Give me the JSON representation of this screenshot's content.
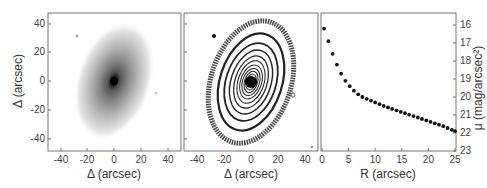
{
  "figure": {
    "panels": [
      {
        "id": "image-panel",
        "kind": "galaxy-image",
        "xlabel": "Δ (arcsec)",
        "ylabel": "Δ (arcsec)",
        "xticks": [
          "-40",
          "-20",
          "0",
          "20",
          "40"
        ],
        "yticks": [
          "40",
          "20",
          "0",
          "-20",
          "-40"
        ]
      },
      {
        "id": "isophote-panel",
        "kind": "isophote-contours",
        "xlabel": "Δ (arcsec)",
        "xticks": [
          "-40",
          "-20",
          "0",
          "20",
          "40"
        ]
      },
      {
        "id": "profile-panel",
        "kind": "surface-brightness-profile",
        "xlabel": "R (arcsec)",
        "ylabel": "μ (mag/arcsec²)",
        "xticks": [
          "0",
          "5",
          "10",
          "15",
          "20",
          "25"
        ],
        "yticks": [
          "16",
          "17",
          "18",
          "19",
          "20",
          "21",
          "22",
          "23"
        ]
      }
    ],
    "colors": {
      "frame": "#777777",
      "dots": "#111111",
      "text": "#444444"
    }
  },
  "chart_data": [
    {
      "type": "heatmap",
      "title": "",
      "xlabel": "Δ (arcsec)",
      "ylabel": "Δ (arcsec)",
      "xlim": [
        -47,
        47
      ],
      "ylim": [
        -47,
        47
      ],
      "xticks": [
        -40,
        -20,
        0,
        20,
        40
      ],
      "yticks": [
        -40,
        -20,
        0,
        20,
        40
      ],
      "description": "Grayscale image of elliptical galaxy, bright nucleus at (0,0), elongated along ~NW-SE tilt"
    },
    {
      "type": "heatmap",
      "title": "",
      "xlabel": "Δ (arcsec)",
      "ylabel": "",
      "xlim": [
        -47,
        47
      ],
      "ylim": [
        -47,
        47
      ],
      "xticks": [
        -40,
        -20,
        0,
        20,
        40
      ],
      "description": "Isophote contour map of same galaxy, nested tilted ellipses around center"
    },
    {
      "type": "scatter",
      "title": "",
      "xlabel": "R (arcsec)",
      "ylabel": "μ (mag/arcsec²)",
      "xlim": [
        0,
        25
      ],
      "ylim": [
        23,
        15.5
      ],
      "xticks": [
        0,
        5,
        10,
        15,
        20,
        25
      ],
      "yticks": [
        16,
        17,
        18,
        19,
        20,
        21,
        22,
        23
      ],
      "y_axis_position": "right",
      "y_inverted": true,
      "grid": false,
      "x": [
        0.4,
        1.2,
        2.0,
        2.8,
        3.6,
        4.4,
        5.2,
        6.0,
        6.8,
        7.6,
        8.4,
        9.2,
        10.0,
        10.8,
        11.6,
        12.4,
        13.2,
        14.0,
        14.8,
        15.6,
        16.4,
        17.2,
        18.0,
        18.8,
        19.6,
        20.4,
        21.2,
        22.0,
        22.8,
        23.6,
        24.4,
        25.0
      ],
      "y": [
        16.2,
        16.9,
        17.6,
        18.2,
        18.7,
        19.1,
        19.4,
        19.65,
        19.85,
        20.0,
        20.1,
        20.2,
        20.3,
        20.4,
        20.5,
        20.58,
        20.66,
        20.74,
        20.82,
        20.9,
        20.98,
        21.06,
        21.14,
        21.22,
        21.3,
        21.38,
        21.46,
        21.54,
        21.62,
        21.72,
        21.82,
        21.9
      ]
    }
  ]
}
